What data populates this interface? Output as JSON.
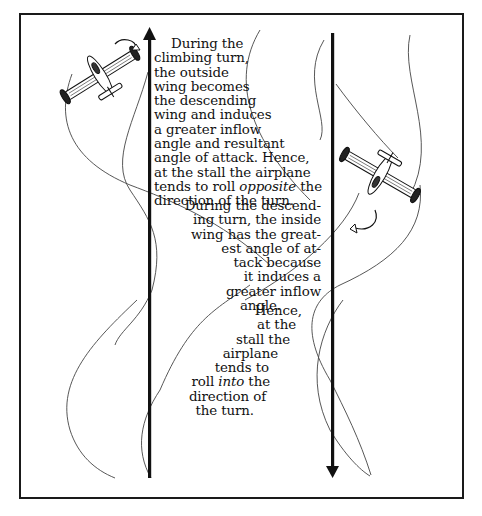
{
  "figure": {
    "type": "diagram",
    "climbing_turn_text": {
      "lines": [
        "During the",
        "climbing turn,",
        "the outside",
        "wing becomes",
        "the descending",
        "wing and induces",
        "a greater inflow",
        "angle and resultant",
        "angle of attack.  Hence,",
        "at the stall the airplane",
        "tends to roll ",
        "the",
        "direction of the turn."
      ],
      "emphasis": "opposite"
    },
    "descending_turn_text": {
      "lines": [
        "During the descend-",
        "ing turn, the inside",
        "wing has the great-",
        "est angle of  at-",
        "tack because",
        "it induces a",
        "greater inflow",
        "angle."
      ]
    },
    "descending_conclusion_text": {
      "lines": [
        "Hence,",
        "at the",
        "stall the",
        "airplane",
        "tends to",
        "roll ",
        "the",
        "direction of",
        "the turn."
      ],
      "emphasis": "into"
    },
    "arrows": [
      {
        "name": "climb-arrow",
        "direction": "up"
      },
      {
        "name": "descent-arrow",
        "direction": "down"
      }
    ],
    "airplanes": [
      {
        "name": "climbing-airplane",
        "roll_arrow": "curved-arrow"
      },
      {
        "name": "descending-airplane",
        "roll_arrow": "curved-arrow"
      }
    ],
    "colors": {
      "ink": "#111111",
      "background": "#ffffff",
      "curve": "#444444"
    }
  }
}
